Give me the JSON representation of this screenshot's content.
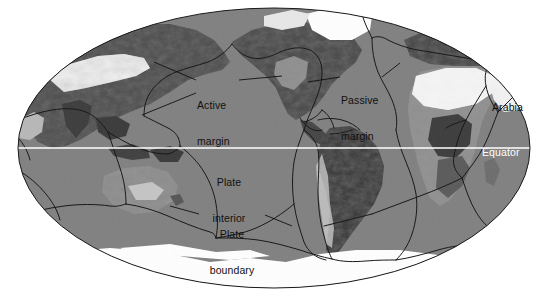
{
  "figure": {
    "type": "world-map",
    "projection": "Mollweide",
    "background_color": "#ffffff",
    "ocean_color": "#808080",
    "ice_color": "#ffffff",
    "boundary_line_color": "#1a1a1a",
    "equator_line_color": "#ffffff"
  },
  "labels": {
    "active_margin": "Active\nmargin",
    "active_margin_line1": "Active",
    "active_margin_line2": "margin",
    "passive_margin_line1": "Passive",
    "passive_margin_line2": "margin",
    "arabia": "Arabia",
    "equator": "Equator",
    "plate_interior_line1": "Plate",
    "plate_interior_line2": "interior",
    "plate_boundary_line1": "Plate",
    "plate_boundary_line2": "boundary"
  }
}
